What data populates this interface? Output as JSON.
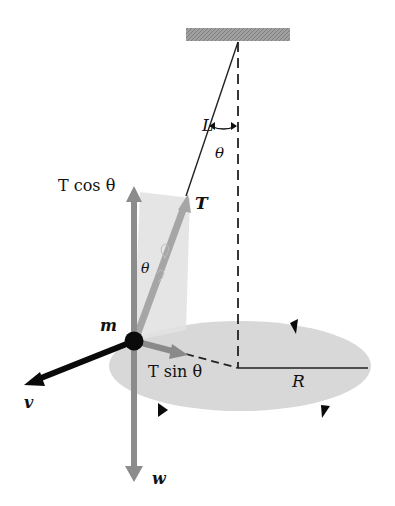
{
  "diagram": {
    "labels": {
      "length": "L",
      "theta_top": "θ",
      "tension": "T",
      "t_cos": "T cos θ",
      "theta_mass": "θ",
      "mass": "m",
      "t_sin": "T sin θ",
      "radius": "R",
      "velocity": "v",
      "weight": "w"
    },
    "colors": {
      "ceiling": "#9a9a9a",
      "ellipse": "#d6d6d6",
      "component_arrow": "#8c8c8c",
      "tension_arrow": "#a8a8a8",
      "plane": "#e4e4e4",
      "mass": "#0a0a0a",
      "line": "#222222"
    },
    "geometry": {
      "pivot": [
        238,
        40
      ],
      "mass": [
        134,
        341
      ],
      "circle_center": [
        238,
        368
      ],
      "radius_end": [
        368,
        368
      ]
    }
  }
}
